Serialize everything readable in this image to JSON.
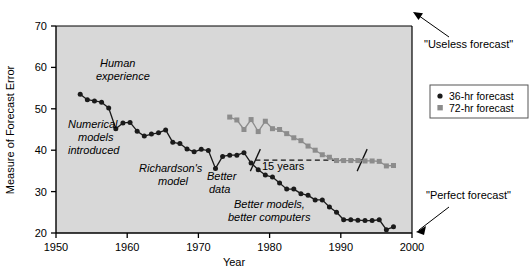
{
  "chart_data": {
    "type": "line",
    "title": "",
    "xlabel": "Year",
    "ylabel": "Measure of Forecast Error",
    "xlim": [
      1950,
      2000
    ],
    "ylim": [
      20,
      70
    ],
    "xticks": [
      1950,
      1960,
      1970,
      1980,
      1990,
      2000
    ],
    "yticks": [
      20,
      30,
      40,
      50,
      60,
      70
    ],
    "grid": false,
    "legend_position": "outside-right",
    "series": [
      {
        "name": "36-hr forecast",
        "marker": "circle",
        "color": "#1a1a1a",
        "x": [
          1953.4,
          1954.4,
          1955.4,
          1956.4,
          1957.4,
          1958.4,
          1959.4,
          1960.4,
          1961.4,
          1962.4,
          1963.4,
          1964.4,
          1965.4,
          1966.4,
          1967.4,
          1968.4,
          1969.4,
          1970.4,
          1971.4,
          1972.4,
          1973.4,
          1974.4,
          1975.4,
          1976.4,
          1977.4,
          1978.4,
          1979.4,
          1980.4,
          1981.4,
          1982.4,
          1983.4,
          1984.4,
          1985.4,
          1986.4,
          1987.4,
          1988.4,
          1989.4,
          1990.4,
          1991.4,
          1992.4,
          1993.4,
          1994.4,
          1995.4,
          1996.4,
          1997.4
        ],
        "y": [
          53.5,
          52.2,
          51.9,
          51.6,
          50.2,
          45.2,
          46.6,
          46.7,
          44.6,
          43.4,
          43.9,
          44.2,
          44.9,
          41.9,
          41.6,
          40.3,
          39.6,
          40.2,
          39.9,
          35.6,
          38.5,
          38.8,
          38.8,
          39.4,
          36.9,
          35.3,
          34.0,
          33.5,
          32.1,
          30.6,
          30.6,
          29.5,
          29.1,
          28.0,
          28.0,
          26.3,
          25.0,
          23.2,
          23.2,
          23.1,
          23.0,
          23.0,
          23.2,
          20.8,
          21.5
        ]
      },
      {
        "name": "72-hr forecast",
        "marker": "square",
        "color": "#8c8c8c",
        "x": [
          1974.4,
          1975.4,
          1976.4,
          1977.4,
          1978.4,
          1979.4,
          1980.4,
          1981.4,
          1982.4,
          1983.4,
          1984.4,
          1985.4,
          1986.4,
          1987.4,
          1988.4,
          1989.4,
          1990.4,
          1991.4,
          1992.4,
          1993.4,
          1994.4,
          1995.4,
          1996.4,
          1997.4
        ],
        "y": [
          48.0,
          47.3,
          45.0,
          47.4,
          44.5,
          47.0,
          45.2,
          45.0,
          44.0,
          43.0,
          42.3,
          41.0,
          40.0,
          38.9,
          38.3,
          37.5,
          37.5,
          37.5,
          37.5,
          37.4,
          37.4,
          37.3,
          36.2,
          36.3
        ]
      }
    ],
    "annotations": [
      {
        "id": "human-experience",
        "text": "Human\nexperience",
        "x": 1960.0,
        "y": 59.0,
        "style": "italic"
      },
      {
        "id": "numerical-models-introduced",
        "text": "Numerical\nmodels\nintroduced",
        "x": 1957.3,
        "y": 44.0,
        "style": "italic"
      },
      {
        "id": "richardsons-model",
        "text": "Richardson's\nmodel",
        "x": 1970.3,
        "y": 35.5,
        "style": "italic"
      },
      {
        "id": "better-data",
        "text": "Better\ndata",
        "x": 1977.5,
        "y": 32.8,
        "style": "italic"
      },
      {
        "id": "better-models-better-computers",
        "text": "Better models,\nbetter computers",
        "x": 1985.5,
        "y": 26.8,
        "style": "italic"
      },
      {
        "id": "fifteen-years",
        "text": "15 years",
        "x": 1984.0,
        "y": 36.0,
        "style": "plain"
      },
      {
        "id": "useless-forecast",
        "text": "\"Useless forecast\"",
        "x": 2003.0,
        "y": 64.5,
        "style": "plain"
      },
      {
        "id": "perfect-forecast",
        "text": "\"Perfect forecast\"",
        "x": 2003.0,
        "y": 24.0,
        "style": "plain"
      }
    ],
    "span_marker": {
      "label": "15 years",
      "y": 37.6,
      "x_start": 1978.0,
      "x_end": 1993.0
    }
  },
  "axes": {
    "y_label": "Measure of Forecast Error",
    "x_label": "Year",
    "x_tick_labels": [
      "1950",
      "1960",
      "1970",
      "1980",
      "1990",
      "2000"
    ],
    "y_tick_labels": [
      "20",
      "30",
      "40",
      "50",
      "60",
      "70"
    ]
  },
  "legend": {
    "entries": [
      {
        "label": "36-hr forecast",
        "marker": "circle",
        "color": "#1a1a1a"
      },
      {
        "label": "72-hr forecast",
        "marker": "square",
        "color": "#8c8c8c"
      }
    ]
  },
  "callouts": {
    "useless": "\"Useless forecast\"",
    "perfect": "\"Perfect forecast\""
  },
  "annotations_text": {
    "human_experience_l1": "Human",
    "human_experience_l2": "experience",
    "numerical_l1": "Numerical",
    "numerical_l2": "models",
    "numerical_l3": "introduced",
    "richardson_l1": "Richardson's",
    "richardson_l2": "model",
    "better_data_l1": "Better",
    "better_data_l2": "data",
    "better_models_l1": "Better models,",
    "better_models_l2": "better computers",
    "fifteen_years": "15 years"
  },
  "colors": {
    "plot_background": "#d8d8d8",
    "axis": "#000000",
    "series_36hr": "#1a1a1a",
    "series_72hr": "#8c8c8c",
    "page_background": "#ffffff"
  }
}
